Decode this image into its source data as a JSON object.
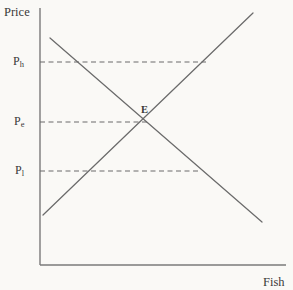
{
  "chart_data": {
    "type": "line",
    "title": "",
    "subtitle": "",
    "xlabel": "Fish",
    "ylabel": "Price",
    "grid": false,
    "legend": null,
    "xlim": [
      0,
      1
    ],
    "ylim": [
      0,
      1
    ],
    "axes": {
      "x_axis_label": "Fish",
      "y_axis_label": "Price",
      "x_ticks": [],
      "y_ticks": [
        "P",
        "P",
        "P"
      ],
      "y_tick_labels": [
        "Ph",
        "Pe",
        "Pl"
      ],
      "arrowheads": false
    },
    "series": [
      {
        "name": "Demand",
        "type": "line",
        "style": "solid",
        "color": "#6b6b6b",
        "points": [
          [
            50,
            38
          ],
          [
            262,
            222
          ]
        ],
        "slope": "negative",
        "description": "downward-sloping demand curve"
      },
      {
        "name": "Supply",
        "type": "line",
        "style": "solid",
        "color": "#6b6b6b",
        "points": [
          [
            43,
            215
          ],
          [
            253,
            13
          ]
        ],
        "slope": "positive",
        "description": "upward-sloping supply curve"
      }
    ],
    "reference_lines": [
      {
        "name": "Ph-guide",
        "label": "Ph",
        "orientation": "horizontal",
        "style": "dashed",
        "color": "#6b6b6b",
        "y_pixel": 62,
        "x_from": 40,
        "x_to": 206,
        "meaning": "high price above equilibrium"
      },
      {
        "name": "Pe-guide",
        "label": "Pe",
        "orientation": "horizontal",
        "style": "dashed",
        "color": "#6b6b6b",
        "y_pixel": 122,
        "x_from": 40,
        "x_to": 150,
        "meaning": "equilibrium price"
      },
      {
        "name": "Pl-guide",
        "label": "Pl",
        "orientation": "horizontal",
        "style": "dashed",
        "color": "#6b6b6b",
        "y_pixel": 171,
        "x_from": 40,
        "x_to": 199,
        "meaning": "low price below equilibrium"
      }
    ],
    "annotations": [
      {
        "name": "equilibrium-point",
        "label": "E",
        "x_pixel": 148,
        "y_pixel": 122,
        "marker": "none",
        "meaning": "equilibrium where supply meets demand"
      }
    ]
  },
  "labels": {
    "y_axis_title": "Price",
    "x_axis_title": "Fish",
    "price_high_base": "P",
    "price_high_sub": "h",
    "price_eq_base": "P",
    "price_eq_sub": "e",
    "price_low_base": "P",
    "price_low_sub": "l",
    "equilibrium": "E"
  },
  "colors": {
    "background": "#faf9f6",
    "line": "#6b6b6b",
    "axis": "#7a7a7a",
    "text": "#3a3a3a"
  }
}
